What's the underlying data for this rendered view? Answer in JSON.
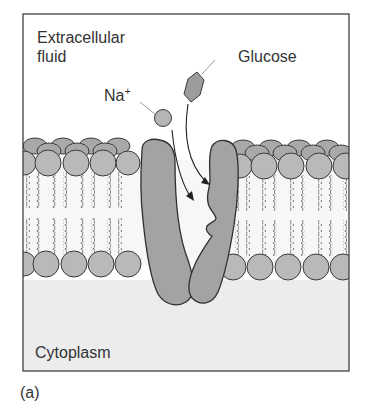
{
  "figure": {
    "panel_label": "(a)",
    "labels": {
      "extracellular_line1": "Extracellular",
      "extracellular_line2": "fluid",
      "sodium": "Na",
      "sodium_charge": "+",
      "glucose": "Glucose",
      "cytoplasm": "Cytoplasm"
    },
    "colors": {
      "head_fill": "#b9b9b9",
      "protein_fill": "#a3a3a3",
      "outline": "#3a3a3a",
      "cytoplasm_bg": "#ececec",
      "tail": "#777777"
    }
  }
}
